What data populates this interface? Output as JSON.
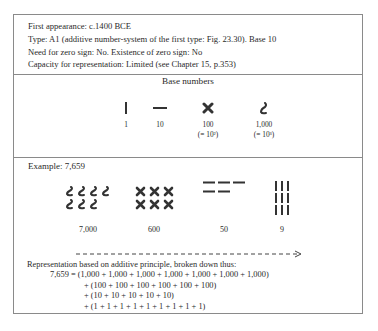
{
  "info": {
    "first_appearance": "First appearance: c.1400 BCE",
    "type": "Type: A1 (additive number-system of the first type: Fig. 23.30). Base 10",
    "zero": "Need for zero sign: No. Existence of zero sign: No",
    "capacity": "Capacity for representation: Limited (see Chapter 15, p.353)"
  },
  "base_numbers": {
    "title": "Base numbers",
    "items": [
      {
        "glyph": "vertical-stroke",
        "value": "1",
        "note": ""
      },
      {
        "glyph": "horizontal-stroke",
        "value": "10",
        "note": ""
      },
      {
        "glyph": "cross",
        "value": "100",
        "note": "(= 10²)"
      },
      {
        "glyph": "hook",
        "value": "1,000",
        "note": "(= 10³)"
      }
    ]
  },
  "example": {
    "title": "Example: 7,659",
    "groups": [
      {
        "glyph": "hook",
        "count": 7,
        "label": "7,000"
      },
      {
        "glyph": "cross",
        "count": 6,
        "label": "600"
      },
      {
        "glyph": "horizontal-stroke",
        "count": 5,
        "label": "50"
      },
      {
        "glyph": "vertical-stroke",
        "count": 9,
        "label": "9"
      }
    ],
    "reading_direction": "left-to-right"
  },
  "representation": {
    "intro": "Representation based on additive principle, broken down thus:",
    "lines": [
      "7,659 = (1,000 + 1,000 + 1,000 + 1,000 + 1,000 + 1,000 + 1,000)",
      "+ (100 + 100 + 100 + 100 + 100 + 100)",
      "+ (10 + 10 + 10 + 10 + 10)",
      "+ (1 + 1 + 1 + 1 + 1 + 1 + 1 + 1 + 1)"
    ]
  },
  "colors": {
    "ink": "#2a2a2a",
    "border": "#8a8a8a"
  }
}
